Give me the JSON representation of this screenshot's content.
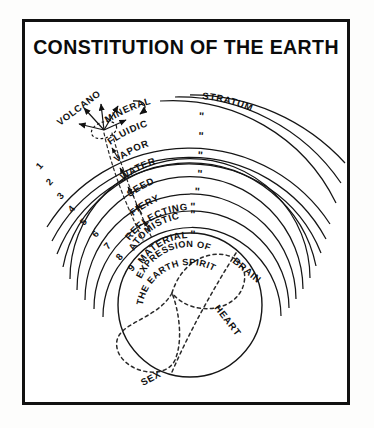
{
  "page": {
    "title": "CONSTITUTION OF THE EARTH",
    "background_color": "#fdfdfc",
    "frame_color": "#111111",
    "ink_color": "#111111"
  },
  "diagram": {
    "type": "concentric-sphere-cross-section",
    "center_label_group": {
      "brain": "BRAIN",
      "heart": "HEART",
      "sex": "SEX"
    },
    "core_caption_line1": "EXPRESSION OF",
    "core_caption_line2": "THE EARTH SPIRIT",
    "volcano_label": "VOLCANO",
    "stratum_header": "STRATUM",
    "ditto_mark": "\"",
    "layers": [
      {
        "number": "1",
        "name": "MINERAL",
        "stratum": "STRATUM"
      },
      {
        "number": "2",
        "name": "FLUIDIC",
        "stratum": "\""
      },
      {
        "number": "3",
        "name": "VAPOR",
        "stratum": "\""
      },
      {
        "number": "4",
        "name": "WATER",
        "stratum": "\""
      },
      {
        "number": "5",
        "name": "SEED",
        "stratum": "\""
      },
      {
        "number": "6",
        "name": "FIERY",
        "stratum": "\""
      },
      {
        "number": "7",
        "name": "REFLECTING",
        "stratum": "\""
      },
      {
        "number": "8",
        "name": "ATOMISTIC",
        "stratum": "\""
      },
      {
        "number": "9",
        "name": "MATERIAL",
        "stratum": "\""
      }
    ]
  }
}
